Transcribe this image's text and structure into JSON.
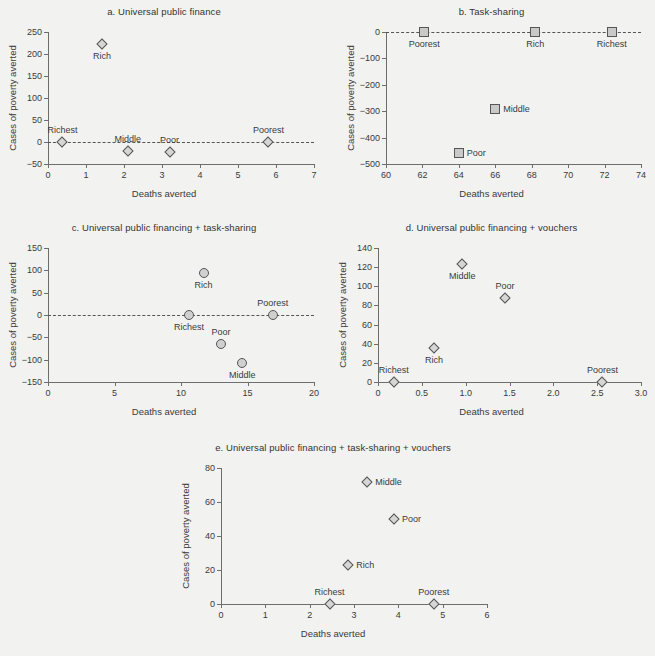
{
  "figure": {
    "axis_titles": {
      "x": "Deaths averted",
      "y": "Cases of poverty averted"
    }
  },
  "chart_data": [
    {
      "id": "a",
      "type": "scatter",
      "title": "a. Universal public finance",
      "xlabel": "Deaths averted",
      "ylabel": "Cases of poverty averted",
      "xlim": [
        0,
        7
      ],
      "ylim": [
        -50,
        250
      ],
      "xticks": [
        "0",
        "1",
        "2",
        "3",
        "4",
        "5",
        "6",
        "7"
      ],
      "xtickvals": [
        0,
        1,
        2,
        3,
        4,
        5,
        6,
        7
      ],
      "yticks": [
        "250",
        "200",
        "150",
        "100",
        "50",
        "0",
        "-50"
      ],
      "ytickvals": [
        250,
        200,
        150,
        100,
        50,
        0,
        -50
      ],
      "marker": "diamond",
      "zero_line": true,
      "grid": false,
      "points": [
        {
          "label": "Richest",
          "x": 0.38,
          "y": 0,
          "label_pos": "above"
        },
        {
          "label": "Rich",
          "x": 1.42,
          "y": 223,
          "label_pos": "below"
        },
        {
          "label": "Middle",
          "x": 2.1,
          "y": -20,
          "label_pos": "above"
        },
        {
          "label": "Poor",
          "x": 3.2,
          "y": -22,
          "label_pos": "above"
        },
        {
          "label": "Poorest",
          "x": 5.8,
          "y": 0,
          "label_pos": "above"
        }
      ]
    },
    {
      "id": "b",
      "type": "scatter",
      "title": "b. Task-sharing",
      "xlabel": "Deaths averted",
      "ylabel": "Cases of poverty averted",
      "xlim": [
        60,
        74
      ],
      "ylim": [
        -500,
        0
      ],
      "xticks": [
        "60",
        "62",
        "64",
        "66",
        "68",
        "70",
        "72",
        "74"
      ],
      "xtickvals": [
        60,
        62,
        64,
        66,
        68,
        70,
        72,
        74
      ],
      "yticks": [
        "0",
        "-100",
        "-200",
        "-300",
        "-400",
        "-500"
      ],
      "ytickvals": [
        0,
        -100,
        -200,
        -300,
        -400,
        -500
      ],
      "marker": "square",
      "zero_line": true,
      "grid": false,
      "points": [
        {
          "label": "Poorest",
          "x": 62.1,
          "y": 0,
          "label_pos": "below"
        },
        {
          "label": "Rich",
          "x": 68.2,
          "y": 0,
          "label_pos": "below"
        },
        {
          "label": "Richest",
          "x": 72.4,
          "y": 0,
          "label_pos": "below"
        },
        {
          "label": "Middle",
          "x": 66.0,
          "y": -293,
          "label_pos": "right"
        },
        {
          "label": "Poor",
          "x": 64.0,
          "y": -458,
          "label_pos": "right"
        }
      ]
    },
    {
      "id": "c",
      "type": "scatter",
      "title": "c. Universal public financing + task-sharing",
      "xlabel": "Deaths averted",
      "ylabel": "Cases of poverty averted",
      "xlim": [
        0,
        20
      ],
      "ylim": [
        -150,
        150
      ],
      "xticks": [
        "0",
        "5",
        "10",
        "15",
        "20"
      ],
      "xtickvals": [
        0,
        5,
        10,
        15,
        20
      ],
      "yticks": [
        "150",
        "100",
        "50",
        "0",
        "-50",
        "-100",
        "-150"
      ],
      "ytickvals": [
        150,
        100,
        50,
        0,
        -50,
        -100,
        -150
      ],
      "marker": "circle",
      "zero_line": true,
      "grid": false,
      "points": [
        {
          "label": "Rich",
          "x": 11.7,
          "y": 93,
          "label_pos": "below"
        },
        {
          "label": "Richest",
          "x": 10.6,
          "y": 0,
          "label_pos": "below"
        },
        {
          "label": "Poorest",
          "x": 16.9,
          "y": 0,
          "label_pos": "above"
        },
        {
          "label": "Poor",
          "x": 13.0,
          "y": -64,
          "label_pos": "above"
        },
        {
          "label": "Middle",
          "x": 14.6,
          "y": -108,
          "label_pos": "below"
        }
      ]
    },
    {
      "id": "d",
      "type": "scatter",
      "title": "d. Universal public financing + vouchers",
      "xlabel": "Deaths averted",
      "ylabel": "Cases of poverty averted",
      "xlim": [
        0,
        3.0
      ],
      "ylim": [
        0,
        140
      ],
      "xticks": [
        "0",
        "0.5",
        "1.0",
        "1.5",
        "2.0",
        "2.5",
        "3.0"
      ],
      "xtickvals": [
        0,
        0.5,
        1.0,
        1.5,
        2.0,
        2.5,
        3.0
      ],
      "yticks": [
        "140",
        "120",
        "100",
        "80",
        "60",
        "40",
        "20",
        "0"
      ],
      "ytickvals": [
        140,
        120,
        100,
        80,
        60,
        40,
        20,
        0
      ],
      "marker": "diamond",
      "zero_line": false,
      "grid": false,
      "points": [
        {
          "label": "Richest",
          "x": 0.18,
          "y": 0,
          "label_pos": "above"
        },
        {
          "label": "Rich",
          "x": 0.64,
          "y": 36,
          "label_pos": "below"
        },
        {
          "label": "Middle",
          "x": 0.96,
          "y": 123,
          "label_pos": "below"
        },
        {
          "label": "Poor",
          "x": 1.45,
          "y": 88,
          "label_pos": "above"
        },
        {
          "label": "Poorest",
          "x": 2.56,
          "y": 0,
          "label_pos": "above"
        }
      ]
    },
    {
      "id": "e",
      "type": "scatter",
      "title": "e. Universal public financing + task-sharing + vouchers",
      "xlabel": "Deaths averted",
      "ylabel": "Cases of poverty averted",
      "xlim": [
        0,
        6
      ],
      "ylim": [
        0,
        80
      ],
      "xticks": [
        "0",
        "1",
        "2",
        "3",
        "4",
        "5",
        "6"
      ],
      "xtickvals": [
        0,
        1,
        2,
        3,
        4,
        5,
        6
      ],
      "yticks": [
        "80",
        "60",
        "40",
        "20",
        "0"
      ],
      "ytickvals": [
        80,
        60,
        40,
        20,
        0
      ],
      "marker": "diamond",
      "zero_line": false,
      "grid": false,
      "points": [
        {
          "label": "Middle",
          "x": 3.3,
          "y": 72,
          "label_pos": "right"
        },
        {
          "label": "Poor",
          "x": 3.9,
          "y": 50,
          "label_pos": "right"
        },
        {
          "label": "Rich",
          "x": 2.87,
          "y": 23,
          "label_pos": "right"
        },
        {
          "label": "Richest",
          "x": 2.45,
          "y": 0,
          "label_pos": "above"
        },
        {
          "label": "Poorest",
          "x": 4.8,
          "y": 0,
          "label_pos": "above"
        }
      ]
    }
  ]
}
